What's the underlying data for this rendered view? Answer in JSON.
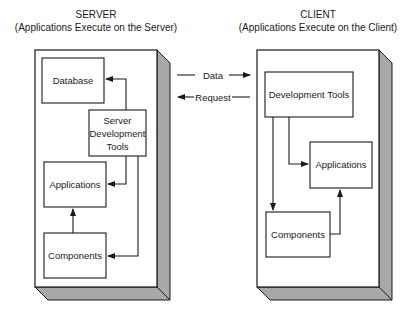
{
  "server": {
    "title": "SERVER",
    "subtitle": "(Applications Execute on the Server)",
    "boxes": {
      "database": "Database",
      "dev_tools": [
        "Server",
        "Development",
        "Tools"
      ],
      "applications": "Applications",
      "components": "Components"
    }
  },
  "client": {
    "title": "CLIENT",
    "subtitle": "(Applications Execute on the Client)",
    "boxes": {
      "dev_tools": "Development Tools",
      "applications": "Applications",
      "components": "Components"
    }
  },
  "links": {
    "data": "Data",
    "request": "Request"
  },
  "colors": {
    "stroke": "#1a1a1a",
    "shadow": "#a8a8a8",
    "panel": "#ffffff"
  }
}
